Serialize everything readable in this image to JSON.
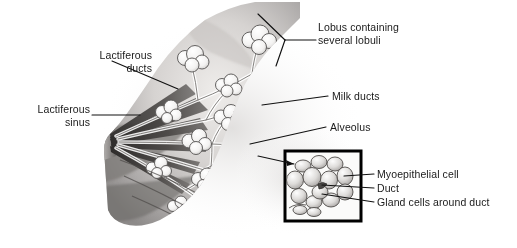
{
  "figure": {
    "width": 517,
    "height": 248,
    "background_color": "#ffffff",
    "ink_color": "#1a1a1a",
    "style": "grayscale pencil and wash anatomical illustration"
  },
  "labels": {
    "lactiferous_ducts": "Lactiferous\nducts",
    "lactiferous_sinus": "Lactiferous\nsinus",
    "lobus": "Lobus containing\nseveral lobuli",
    "milk_ducts": "Milk ducts",
    "alveolus": "Alveolus",
    "myoepithelial_cell": "Myoepithelial cell",
    "duct": "Duct",
    "gland_cells": "Gland cells around duct"
  },
  "inset": {
    "name": "lobule-detail-inset",
    "border_color": "#000000",
    "border_width": 3,
    "x": 285,
    "y": 151,
    "width": 76,
    "height": 70
  },
  "palette": {
    "skin_light": "#e8e6e4",
    "skin_mid": "#b9b6b4",
    "skin_dark": "#6e6b6a",
    "duct_dark": "#3a3836",
    "lobule_white": "#fbfbfa",
    "lobule_outline": "#5c5a58",
    "leader_line": "#111111"
  }
}
